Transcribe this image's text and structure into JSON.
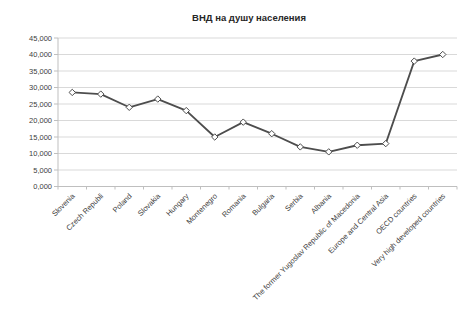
{
  "chart_data": {
    "type": "line",
    "title": "ВНД на душу населения",
    "categories": [
      "Slovenia",
      "Czech Republi",
      "Poland",
      "Slovakia",
      "Hungary",
      "Montenegro",
      "Romania",
      "Bulgaria",
      "Serbia",
      "Albania",
      "The former Yugoslav Republic of Macedonia",
      "Europe and Central Asia",
      "OECD countries",
      "Very high developed countries"
    ],
    "values": [
      28500,
      28000,
      24000,
      26500,
      23000,
      15000,
      19500,
      16000,
      12000,
      10500,
      12500,
      13000,
      38000,
      40000
    ],
    "xlabel": "",
    "ylabel": "",
    "ylim": [
      0,
      45000
    ],
    "y_tick_step": 5000,
    "y_tick_labels": [
      "0,000",
      "5,000",
      "10,000",
      "15,000",
      "20,000",
      "25,000",
      "30,000",
      "35,000",
      "40,000",
      "45,000"
    ],
    "grid": "horizontal",
    "legend": "none",
    "marker": "open-diamond",
    "colors": {
      "line": "#4d4d4d",
      "marker_fill": "#ffffff",
      "marker_stroke": "#4d4d4d",
      "gridline": "#d9d9d9",
      "axis": "#bfbfbf",
      "text": "#404040",
      "background": "#ffffff"
    }
  }
}
